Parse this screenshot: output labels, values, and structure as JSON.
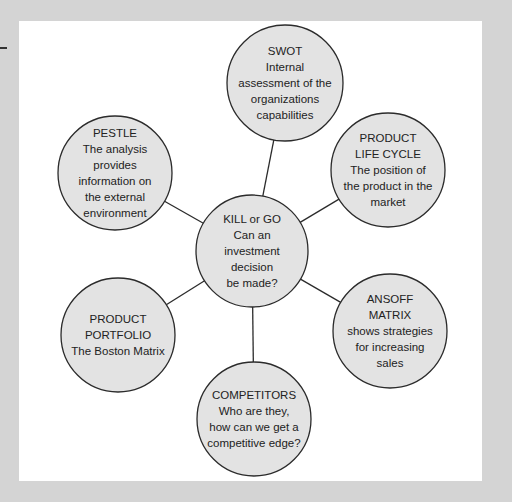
{
  "diagram": {
    "center": {
      "id": "kill-or-go",
      "lines": [
        "KILL or GO",
        "Can an",
        "investment",
        "decision",
        "be made?"
      ]
    },
    "nodes": [
      {
        "id": "swot",
        "lines": [
          "SWOT",
          "Internal",
          "assessment of the",
          "organizations",
          "capabilities"
        ]
      },
      {
        "id": "product-life-cycle",
        "lines": [
          "PRODUCT",
          "LIFE CYCLE",
          "The position of",
          "the product in the",
          "market"
        ]
      },
      {
        "id": "ansoff-matrix",
        "lines": [
          "ANSOFF",
          "MATRIX",
          "shows strategies",
          "for increasing",
          "sales"
        ]
      },
      {
        "id": "competitors",
        "lines": [
          "COMPETITORS",
          "Who are they,",
          "how can we get a",
          "competitive edge?"
        ]
      },
      {
        "id": "product-portfolio",
        "lines": [
          "PRODUCT",
          "PORTFOLIO",
          "The Boston Matrix"
        ]
      },
      {
        "id": "pestle",
        "lines": [
          "PESTLE",
          "The analysis",
          "provides",
          "information on",
          "the external",
          "environment"
        ]
      }
    ],
    "colors": {
      "circle_fill": "#e3e3e3",
      "stroke": "#2b2b2b",
      "panel": "#ffffff",
      "background": "#d4d4d4"
    }
  }
}
